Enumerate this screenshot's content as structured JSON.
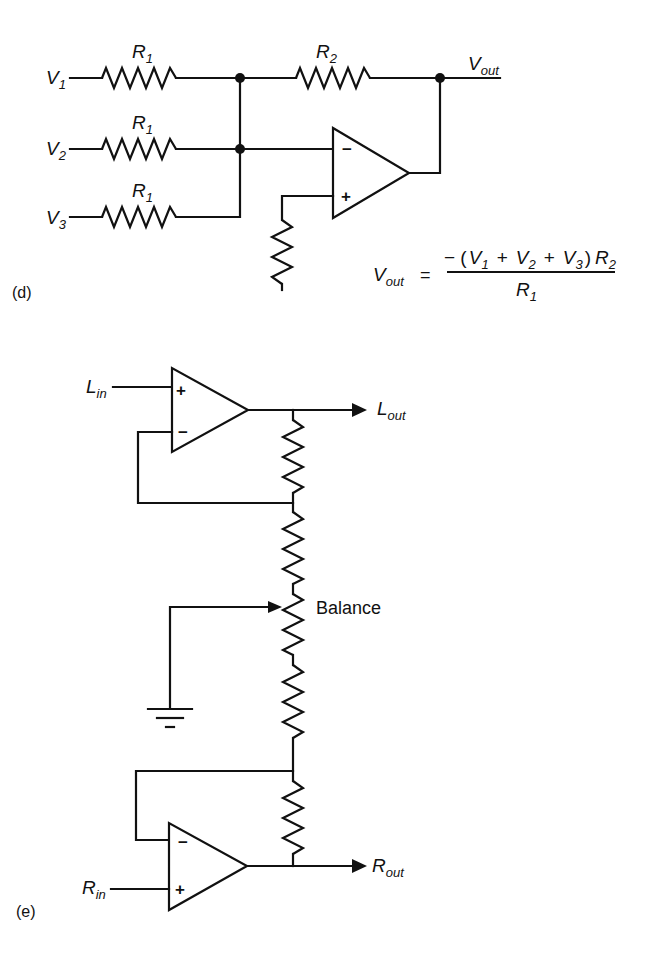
{
  "figure": {
    "part_d": {
      "caption": "(d)",
      "inputs": [
        {
          "base": "V",
          "sub": "1"
        },
        {
          "base": "V",
          "sub": "2"
        },
        {
          "base": "V",
          "sub": "3"
        }
      ],
      "input_resistors": [
        {
          "base": "R",
          "sub": "1"
        },
        {
          "base": "R",
          "sub": "1"
        },
        {
          "base": "R",
          "sub": "1"
        }
      ],
      "feedback_resistor": {
        "base": "R",
        "sub": "2"
      },
      "output": {
        "base": "V",
        "sub": "out"
      },
      "opamp": {
        "inverting": "−",
        "noninverting": "+"
      },
      "formula": {
        "lhs_base": "V",
        "lhs_sub": "out",
        "equals": "=",
        "numerator_prefix": "− (",
        "terms": [
          {
            "base": "V",
            "sub": "1"
          },
          {
            "base": "V",
            "sub": "2"
          },
          {
            "base": "V",
            "sub": "3"
          }
        ],
        "plus": "+",
        "numerator_suffix": ")",
        "numerator_factor": {
          "base": "R",
          "sub": "2"
        },
        "denominator": {
          "base": "R",
          "sub": "1"
        }
      }
    },
    "part_e": {
      "caption": "(e)",
      "left_input": {
        "base": "L",
        "sub": "in"
      },
      "left_output": {
        "base": "L",
        "sub": "out"
      },
      "right_input": {
        "base": "R",
        "sub": "in"
      },
      "right_output": {
        "base": "R",
        "sub": "out"
      },
      "pot_label": "Balance",
      "top_opamp": {
        "noninverting": "+",
        "inverting": "−"
      },
      "bottom_opamp": {
        "inverting": "−",
        "noninverting": "+"
      }
    }
  }
}
